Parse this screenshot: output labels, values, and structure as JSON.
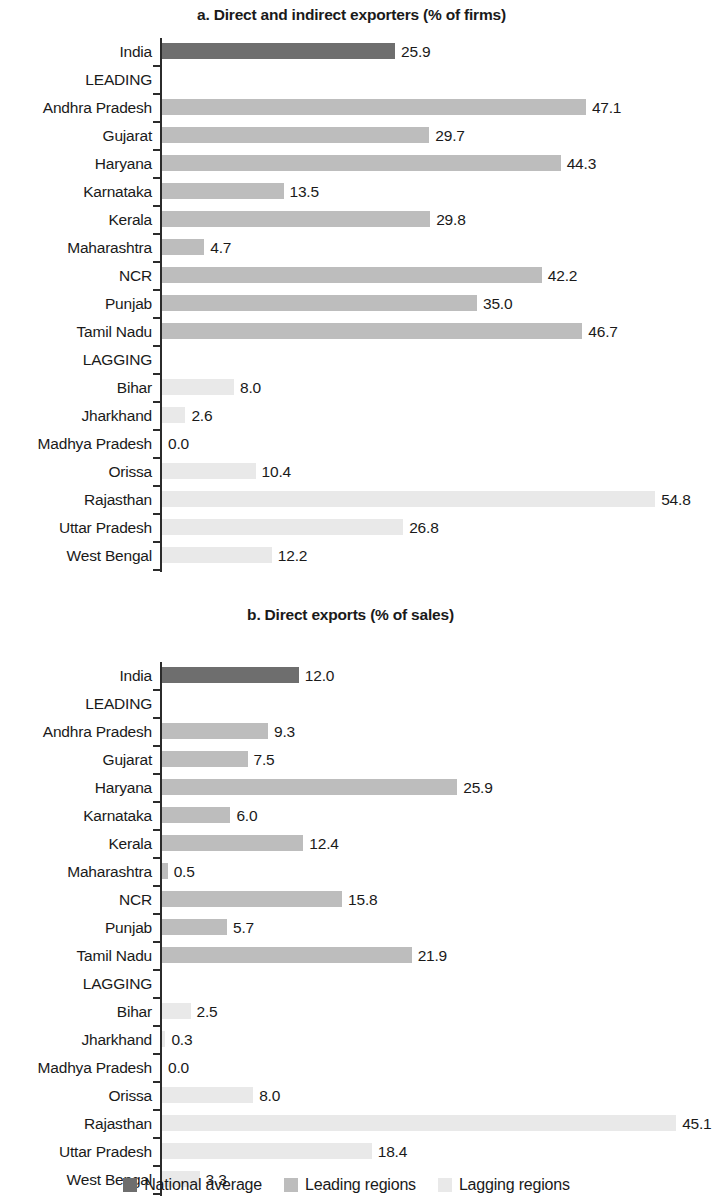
{
  "chart_data": [
    {
      "type": "bar",
      "id": "panel-a",
      "title": "a. Direct and indirect exporters (% of firms)",
      "xlabel": "",
      "ylabel": "",
      "orientation": "horizontal",
      "grid": false,
      "xlim": [
        0,
        60
      ],
      "px_per_unit": 9.0,
      "categories": [
        "India",
        "LEADING",
        "Andhra Pradesh",
        "Gujarat",
        "Haryana",
        "Karnataka",
        "Kerala",
        "Maharashtra",
        "NCR",
        "Punjab",
        "Tamil Nadu",
        "LAGGING",
        "Bihar",
        "Jharkhand",
        "Madhya Pradesh",
        "Orissa",
        "Rajasthan",
        "Uttar Pradesh",
        "West Bengal"
      ],
      "rows": [
        {
          "label": "India",
          "value": 25.9,
          "display": "25.9",
          "group": "national",
          "header": false
        },
        {
          "label": "LEADING",
          "value": null,
          "display": "",
          "group": "header",
          "header": true
        },
        {
          "label": "Andhra Pradesh",
          "value": 47.1,
          "display": "47.1",
          "group": "leading",
          "header": false
        },
        {
          "label": "Gujarat",
          "value": 29.7,
          "display": "29.7",
          "group": "leading",
          "header": false
        },
        {
          "label": "Haryana",
          "value": 44.3,
          "display": "44.3",
          "group": "leading",
          "header": false
        },
        {
          "label": "Karnataka",
          "value": 13.5,
          "display": "13.5",
          "group": "leading",
          "header": false
        },
        {
          "label": "Kerala",
          "value": 29.8,
          "display": "29.8",
          "group": "leading",
          "header": false
        },
        {
          "label": "Maharashtra",
          "value": 4.7,
          "display": "4.7",
          "group": "leading",
          "header": false
        },
        {
          "label": "NCR",
          "value": 42.2,
          "display": "42.2",
          "group": "leading",
          "header": false
        },
        {
          "label": "Punjab",
          "value": 35.0,
          "display": "35.0",
          "group": "leading",
          "header": false
        },
        {
          "label": "Tamil Nadu",
          "value": 46.7,
          "display": "46.7",
          "group": "leading",
          "header": false
        },
        {
          "label": "LAGGING",
          "value": null,
          "display": "",
          "group": "header",
          "header": true
        },
        {
          "label": "Bihar",
          "value": 8.0,
          "display": "8.0",
          "group": "lagging",
          "header": false
        },
        {
          "label": "Jharkhand",
          "value": 2.6,
          "display": "2.6",
          "group": "lagging",
          "header": false
        },
        {
          "label": "Madhya Pradesh",
          "value": 0.0,
          "display": "0.0",
          "group": "lagging",
          "header": false
        },
        {
          "label": "Orissa",
          "value": 10.4,
          "display": "10.4",
          "group": "lagging",
          "header": false
        },
        {
          "label": "Rajasthan",
          "value": 54.8,
          "display": "54.8",
          "group": "lagging",
          "header": false
        },
        {
          "label": "Uttar Pradesh",
          "value": 26.8,
          "display": "26.8",
          "group": "lagging",
          "header": false
        },
        {
          "label": "West Bengal",
          "value": 12.2,
          "display": "12.2",
          "group": "lagging",
          "header": false
        }
      ]
    },
    {
      "type": "bar",
      "id": "panel-b",
      "title": "b. Direct exports (% of sales)",
      "xlabel": "",
      "ylabel": "",
      "orientation": "horizontal",
      "grid": false,
      "xlim": [
        0,
        50
      ],
      "px_per_unit": 11.4,
      "categories": [
        "India",
        "LEADING",
        "Andhra Pradesh",
        "Gujarat",
        "Haryana",
        "Karnataka",
        "Kerala",
        "Maharashtra",
        "NCR",
        "Punjab",
        "Tamil Nadu",
        "LAGGING",
        "Bihar",
        "Jharkhand",
        "Madhya Pradesh",
        "Orissa",
        "Rajasthan",
        "Uttar Pradesh",
        "West Bengal"
      ],
      "rows": [
        {
          "label": "India",
          "value": 12.0,
          "display": "12.0",
          "group": "national",
          "header": false
        },
        {
          "label": "LEADING",
          "value": null,
          "display": "",
          "group": "header",
          "header": true
        },
        {
          "label": "Andhra Pradesh",
          "value": 9.3,
          "display": "9.3",
          "group": "leading",
          "header": false
        },
        {
          "label": "Gujarat",
          "value": 7.5,
          "display": "7.5",
          "group": "leading",
          "header": false
        },
        {
          "label": "Haryana",
          "value": 25.9,
          "display": "25.9",
          "group": "leading",
          "header": false
        },
        {
          "label": "Karnataka",
          "value": 6.0,
          "display": "6.0",
          "group": "leading",
          "header": false
        },
        {
          "label": "Kerala",
          "value": 12.4,
          "display": "12.4",
          "group": "leading",
          "header": false
        },
        {
          "label": "Maharashtra",
          "value": 0.5,
          "display": "0.5",
          "group": "leading",
          "header": false
        },
        {
          "label": "NCR",
          "value": 15.8,
          "display": "15.8",
          "group": "leading",
          "header": false
        },
        {
          "label": "Punjab",
          "value": 5.7,
          "display": "5.7",
          "group": "leading",
          "header": false
        },
        {
          "label": "Tamil Nadu",
          "value": 21.9,
          "display": "21.9",
          "group": "leading",
          "header": false
        },
        {
          "label": "LAGGING",
          "value": null,
          "display": "",
          "group": "header",
          "header": true
        },
        {
          "label": "Bihar",
          "value": 2.5,
          "display": "2.5",
          "group": "lagging",
          "header": false
        },
        {
          "label": "Jharkhand",
          "value": 0.3,
          "display": "0.3",
          "group": "lagging",
          "header": false
        },
        {
          "label": "Madhya Pradesh",
          "value": 0.0,
          "display": "0.0",
          "group": "lagging",
          "header": false
        },
        {
          "label": "Orissa",
          "value": 8.0,
          "display": "8.0",
          "group": "lagging",
          "header": false
        },
        {
          "label": "Rajasthan",
          "value": 45.1,
          "display": "45.1",
          "group": "lagging",
          "header": false
        },
        {
          "label": "Uttar Pradesh",
          "value": 18.4,
          "display": "18.4",
          "group": "lagging",
          "header": false
        },
        {
          "label": "West Bengal",
          "value": 3.3,
          "display": "3.3",
          "group": "lagging",
          "header": false
        }
      ]
    }
  ],
  "legend": {
    "position": "bottom-center",
    "items": [
      {
        "label": "National average",
        "group": "national",
        "color": "#6e6e6e"
      },
      {
        "label": "Leading regions",
        "group": "leading",
        "color": "#bdbdbd"
      },
      {
        "label": "Lagging regions",
        "group": "lagging",
        "color": "#e9e9e9"
      }
    ]
  },
  "colors": {
    "national": "#6e6e6e",
    "leading": "#bdbdbd",
    "lagging": "#e9e9e9",
    "axis": "#2b2b2b",
    "text": "#1a1a1a",
    "background": "#ffffff"
  }
}
